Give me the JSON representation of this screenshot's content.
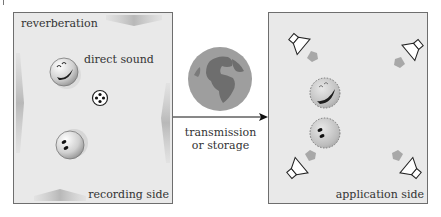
{
  "recording_panel": {
    "reverberation_label": "reverberation",
    "direct_sound_label": "direct sound",
    "side_label": "recording side",
    "icons": [
      "laughing-face-icon",
      "microphone-icon",
      "surprised-face-icon"
    ]
  },
  "transfer": {
    "line1": "transmission",
    "line2": "or storage",
    "icon": "globe-icon"
  },
  "application_panel": {
    "side_label": "application side",
    "icons": [
      "loudspeaker-top-left-icon",
      "loudspeaker-top-right-icon",
      "loudspeaker-bottom-left-icon",
      "loudspeaker-bottom-right-icon",
      "laughing-face-icon",
      "surprised-face-icon"
    ]
  },
  "colors": {
    "panel_fill": "#e9e9e9",
    "panel_border": "#6e6e6e",
    "shade_arrow": "#bdbdbd",
    "globe_ocean": "#9a9a9a",
    "globe_land": "#6f6f6f"
  }
}
